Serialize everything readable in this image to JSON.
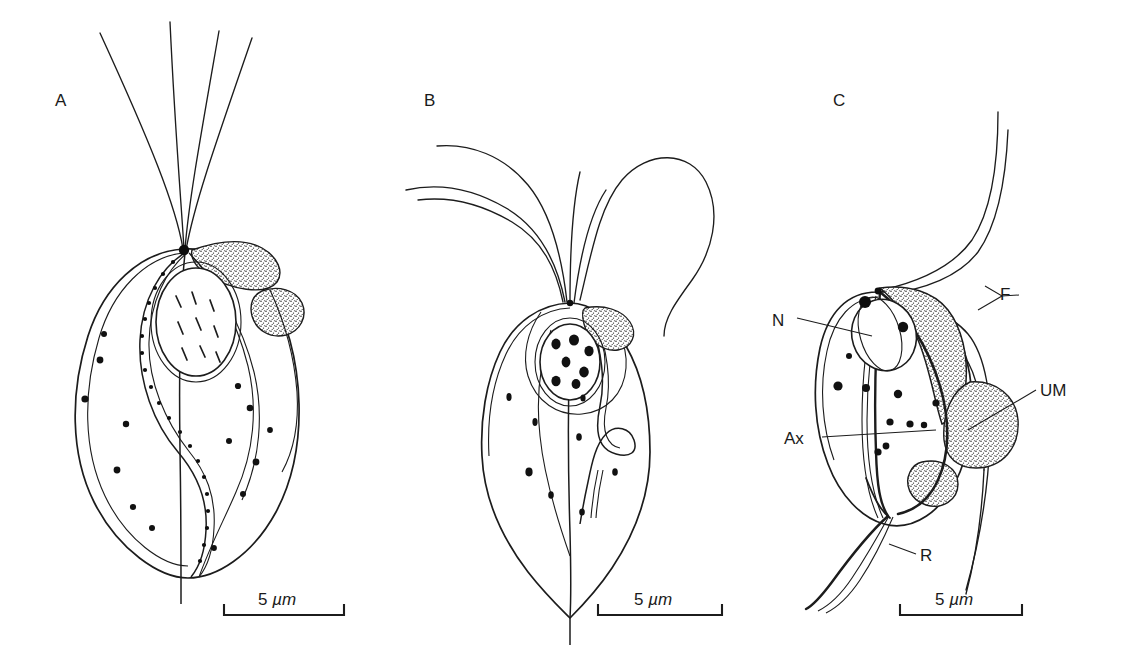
{
  "figure": {
    "background_color": "#ffffff",
    "ink_color": "#1c1c1c",
    "width": 1128,
    "height": 659,
    "caption_letters": [
      "A",
      "B",
      "C"
    ]
  },
  "panels": [
    {
      "id": "A",
      "letter": "A",
      "scale_value": "5",
      "scale_unit": "µm",
      "flagella_count": 4,
      "description": "ovoid trichomonad cell with undulating membrane and axostyle"
    },
    {
      "id": "B",
      "letter": "B",
      "scale_value": "5",
      "scale_unit": "µm",
      "flagella_count": 5,
      "description": "pyriform trichomonad cell with granular nucleus and recurrent flagellum"
    },
    {
      "id": "C",
      "letter": "C",
      "scale_value": "5",
      "scale_unit": "µm",
      "flagella_count": 4,
      "description": "trichomonad cell labelled with nucleus, axostyle, flagella, undulating membrane and recurrent flagellum",
      "labels": [
        {
          "key": "N",
          "text": "N",
          "meaning": "nucleus"
        },
        {
          "key": "Ax",
          "text": "Ax",
          "meaning": "axostyle"
        },
        {
          "key": "F",
          "text": "F",
          "meaning": "flagella"
        },
        {
          "key": "UM",
          "text": "UM",
          "meaning": "undulating membrane"
        },
        {
          "key": "R",
          "text": "R",
          "meaning": "recurrent flagellum"
        }
      ]
    }
  ],
  "scale_bars": [
    {
      "panel": "A",
      "value": "5",
      "unit": "µm"
    },
    {
      "panel": "B",
      "value": "5",
      "unit": "µm"
    },
    {
      "panel": "C",
      "value": "5",
      "unit": "µm"
    }
  ]
}
